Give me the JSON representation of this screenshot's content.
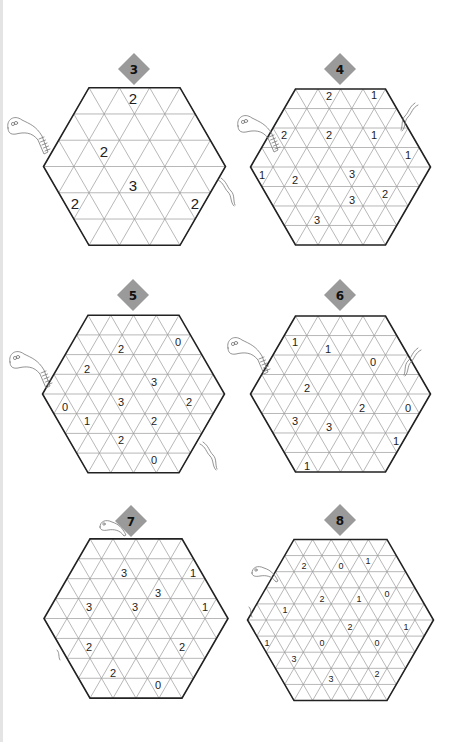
{
  "page": {
    "width": 461,
    "height": 742,
    "background": "#ffffff"
  },
  "colors": {
    "badge": "#9a9a9a",
    "grid_line": "#9a9a9a",
    "outline": "#222222",
    "number": "#222222",
    "snake": "#777777"
  },
  "puzzles": [
    {
      "id": "3",
      "label": "3",
      "badge": {
        "cx": 134,
        "cy": 69,
        "r": 16
      },
      "hex": {
        "cx": 134.5,
        "cy": 166.5,
        "side": 91,
        "n": 3
      },
      "font_size": 15,
      "clues": [
        {
          "x": 133,
          "y": 98,
          "v": "2"
        },
        {
          "x": 104,
          "y": 151,
          "v": "2"
        },
        {
          "x": 133,
          "y": 185,
          "v": "3"
        },
        {
          "x": 75,
          "y": 203,
          "v": "2"
        },
        {
          "x": 195,
          "y": 203,
          "v": "2"
        }
      ],
      "snakes": [
        {
          "type": "head",
          "x": 6,
          "y": 118,
          "dir": 1
        },
        {
          "type": "tail",
          "x": 218,
          "y": 180,
          "dir": 1
        }
      ]
    },
    {
      "id": "4",
      "label": "4",
      "badge": {
        "cx": 340,
        "cy": 69,
        "r": 16
      },
      "hex": {
        "cx": 340.5,
        "cy": 167,
        "side": 90,
        "n": 4
      },
      "font_size": 11,
      "clues": [
        {
          "x": 329,
          "y": 96,
          "v": "2"
        },
        {
          "x": 374,
          "y": 95,
          "v": "1"
        },
        {
          "x": 284,
          "y": 135,
          "v": "2"
        },
        {
          "x": 329,
          "y": 135,
          "v": "2"
        },
        {
          "x": 374,
          "y": 135,
          "v": "1"
        },
        {
          "x": 408,
          "y": 155,
          "v": "1"
        },
        {
          "x": 262,
          "y": 175,
          "v": "1"
        },
        {
          "x": 295,
          "y": 180,
          "v": "2"
        },
        {
          "x": 352,
          "y": 174,
          "v": "3"
        },
        {
          "x": 385,
          "y": 194,
          "v": "2"
        },
        {
          "x": 352,
          "y": 200,
          "v": "3"
        },
        {
          "x": 317,
          "y": 220,
          "v": "3"
        }
      ],
      "snakes": [
        {
          "type": "head",
          "x": 236,
          "y": 116,
          "dir": 1
        },
        {
          "type": "tail",
          "x": 404,
          "y": 105,
          "dir": -1
        }
      ]
    },
    {
      "id": "5",
      "label": "5",
      "badge": {
        "cx": 133,
        "cy": 295,
        "r": 16
      },
      "hex": {
        "cx": 133.5,
        "cy": 394,
        "side": 91,
        "n": 4
      },
      "font_size": 11,
      "clues": [
        {
          "x": 121,
          "y": 349,
          "v": "2"
        },
        {
          "x": 178,
          "y": 342,
          "v": "0"
        },
        {
          "x": 87,
          "y": 369,
          "v": "2"
        },
        {
          "x": 154,
          "y": 382,
          "v": "3"
        },
        {
          "x": 65,
          "y": 407,
          "v": "0"
        },
        {
          "x": 121,
          "y": 402,
          "v": "3"
        },
        {
          "x": 189,
          "y": 402,
          "v": "2"
        },
        {
          "x": 87,
          "y": 421,
          "v": "1"
        },
        {
          "x": 154,
          "y": 421,
          "v": "2"
        },
        {
          "x": 121,
          "y": 440,
          "v": "2"
        },
        {
          "x": 154,
          "y": 460,
          "v": "0"
        }
      ],
      "snakes": [
        {
          "type": "head",
          "x": 8,
          "y": 352,
          "dir": 1
        },
        {
          "type": "tail",
          "x": 200,
          "y": 444,
          "dir": 1
        }
      ]
    },
    {
      "id": "6",
      "label": "6",
      "badge": {
        "cx": 340,
        "cy": 295,
        "r": 16
      },
      "hex": {
        "cx": 340.5,
        "cy": 394,
        "side": 90,
        "n": 4
      },
      "font_size": 11,
      "clues": [
        {
          "x": 295,
          "y": 342,
          "v": "1"
        },
        {
          "x": 328,
          "y": 349,
          "v": "1"
        },
        {
          "x": 373,
          "y": 362,
          "v": "0"
        },
        {
          "x": 307,
          "y": 388,
          "v": "2"
        },
        {
          "x": 362,
          "y": 408,
          "v": "2"
        },
        {
          "x": 408,
          "y": 408,
          "v": "0"
        },
        {
          "x": 295,
          "y": 421,
          "v": "3"
        },
        {
          "x": 329,
          "y": 427,
          "v": "3"
        },
        {
          "x": 396,
          "y": 441,
          "v": "1"
        },
        {
          "x": 307,
          "y": 466,
          "v": "1"
        }
      ],
      "snakes": [
        {
          "type": "head",
          "x": 226,
          "y": 338,
          "dir": 1
        },
        {
          "type": "tail",
          "x": 407,
          "y": 350,
          "dir": -1
        }
      ]
    },
    {
      "id": "7",
      "label": "7",
      "badge": {
        "cx": 131,
        "cy": 521,
        "r": 16
      },
      "hex": {
        "cx": 136,
        "cy": 618.5,
        "side": 92,
        "n": 4
      },
      "font_size": 11,
      "clues": [
        {
          "x": 124,
          "y": 573,
          "v": "3"
        },
        {
          "x": 193,
          "y": 573,
          "v": "1"
        },
        {
          "x": 158,
          "y": 593,
          "v": "3"
        },
        {
          "x": 89,
          "y": 607,
          "v": "3"
        },
        {
          "x": 135,
          "y": 607,
          "v": "3"
        },
        {
          "x": 205,
          "y": 607,
          "v": "1"
        },
        {
          "x": 89,
          "y": 647,
          "v": "2"
        },
        {
          "x": 182,
          "y": 647,
          "v": "2"
        },
        {
          "x": 113,
          "y": 673,
          "v": "2"
        },
        {
          "x": 158,
          "y": 685,
          "v": "0"
        }
      ],
      "snakes": [
        {
          "type": "head-small",
          "x": 100,
          "y": 519,
          "dir": 1
        },
        {
          "type": "tail-small",
          "x": 57,
          "y": 650,
          "dir": 1
        }
      ]
    },
    {
      "id": "8",
      "label": "8",
      "badge": {
        "cx": 340,
        "cy": 520,
        "r": 16
      },
      "hex": {
        "cx": 340.5,
        "cy": 620,
        "side": 93,
        "n": 5
      },
      "font_size": 9,
      "clues": [
        {
          "x": 304,
          "y": 566,
          "v": "2"
        },
        {
          "x": 341,
          "y": 566,
          "v": "0"
        },
        {
          "x": 368,
          "y": 561,
          "v": "1"
        },
        {
          "x": 322,
          "y": 599,
          "v": "2"
        },
        {
          "x": 359,
          "y": 599,
          "v": "1"
        },
        {
          "x": 387,
          "y": 594,
          "v": "0"
        },
        {
          "x": 285,
          "y": 610,
          "v": "1"
        },
        {
          "x": 350,
          "y": 627,
          "v": "2"
        },
        {
          "x": 406,
          "y": 627,
          "v": "1"
        },
        {
          "x": 267,
          "y": 643,
          "v": "1"
        },
        {
          "x": 322,
          "y": 643,
          "v": "0"
        },
        {
          "x": 377,
          "y": 643,
          "v": "0"
        },
        {
          "x": 294,
          "y": 659,
          "v": "3"
        },
        {
          "x": 331,
          "y": 679,
          "v": "3"
        },
        {
          "x": 377,
          "y": 674,
          "v": "2"
        }
      ],
      "snakes": [
        {
          "type": "head-small",
          "x": 252,
          "y": 565,
          "dir": 1
        },
        {
          "type": "tail-small",
          "x": 249,
          "y": 607,
          "dir": 1
        }
      ]
    }
  ]
}
